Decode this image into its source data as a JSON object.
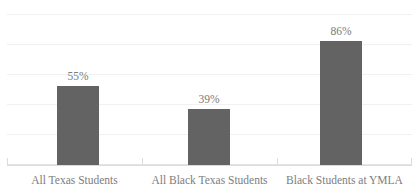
{
  "chart_data": {
    "type": "bar",
    "title": "Assessment",
    "title_clipped": true,
    "xlabel": "",
    "ylabel": "",
    "categories": [
      "All Texas Students",
      "All Black Texas Students",
      "Black Students at YMLA"
    ],
    "values": [
      55,
      39,
      86
    ],
    "value_labels": [
      "55%",
      "39%",
      "86%"
    ],
    "ylim": [
      0,
      105
    ],
    "ytick_values": [
      0,
      21,
      42,
      63,
      84,
      105
    ],
    "ytick_labels": [],
    "gridlines": true,
    "grid_count": 6,
    "legend": null,
    "legend_position": "none",
    "unit": "%",
    "series": [
      {
        "name": "Assessment",
        "values": [
          55,
          39,
          86
        ],
        "color": "#636363"
      }
    ],
    "annotations": []
  },
  "style": {
    "bar_color": "#636363",
    "gridline_color": "#f1f1f1",
    "axis_color": "#dcdcdc",
    "label_color": "#7d7d7d",
    "value_color": "#7a7a7a",
    "title_color": "#6a6a6a",
    "background": "#ffffff"
  }
}
